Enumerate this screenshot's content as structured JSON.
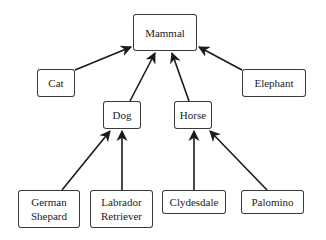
{
  "diagram": {
    "type": "class-hierarchy",
    "colors": {
      "edge": "#1a1a1a",
      "node_border": "#3a3a3a",
      "text": "#222222",
      "background": "#ffffff"
    },
    "nodes": [
      {
        "id": "mammal",
        "label": "Mammal",
        "x": 133,
        "y": 14,
        "w": 64,
        "h": 37
      },
      {
        "id": "cat",
        "label": "Cat",
        "x": 37,
        "y": 69,
        "w": 38,
        "h": 28
      },
      {
        "id": "elephant",
        "label": "Elephant",
        "x": 242,
        "y": 69,
        "w": 64,
        "h": 28
      },
      {
        "id": "dog",
        "label": "Dog",
        "x": 103,
        "y": 101,
        "w": 38,
        "h": 28
      },
      {
        "id": "horse",
        "label": "Horse",
        "x": 174,
        "y": 101,
        "w": 38,
        "h": 28
      },
      {
        "id": "german-shepard",
        "label": "German\nShepard",
        "x": 18,
        "y": 190,
        "w": 62,
        "h": 38
      },
      {
        "id": "labrador-retriever",
        "label": "Labrador\nRetriever",
        "x": 90,
        "y": 190,
        "w": 63,
        "h": 38
      },
      {
        "id": "clydesdale",
        "label": "Clydesdale",
        "x": 162,
        "y": 190,
        "w": 64,
        "h": 24
      },
      {
        "id": "palomino",
        "label": "Palomino",
        "x": 241,
        "y": 190,
        "w": 63,
        "h": 24
      }
    ],
    "edges": [
      {
        "from": "cat",
        "to": "mammal",
        "x1": 75,
        "y1": 70,
        "x2": 131,
        "y2": 47
      },
      {
        "from": "dog",
        "to": "mammal",
        "x1": 130,
        "y1": 101,
        "x2": 155,
        "y2": 53
      },
      {
        "from": "horse",
        "to": "mammal",
        "x1": 189,
        "y1": 101,
        "x2": 172,
        "y2": 53
      },
      {
        "from": "elephant",
        "to": "mammal",
        "x1": 242,
        "y1": 70,
        "x2": 199,
        "y2": 47
      },
      {
        "from": "german-shepard",
        "to": "dog",
        "x1": 62,
        "y1": 190,
        "x2": 110,
        "y2": 131
      },
      {
        "from": "labrador-retriever",
        "to": "dog",
        "x1": 122,
        "y1": 190,
        "x2": 122,
        "y2": 131
      },
      {
        "from": "clydesdale",
        "to": "horse",
        "x1": 194,
        "y1": 190,
        "x2": 194,
        "y2": 131
      },
      {
        "from": "palomino",
        "to": "horse",
        "x1": 267,
        "y1": 190,
        "x2": 210,
        "y2": 131
      }
    ]
  }
}
